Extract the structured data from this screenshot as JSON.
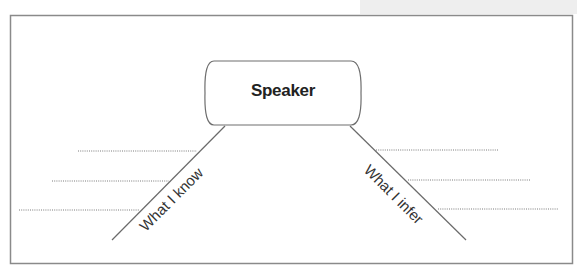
{
  "diagram": {
    "center_node": {
      "label": "Speaker"
    },
    "branches": [
      {
        "label": "What I know",
        "side": "left",
        "blank_lines": 3
      },
      {
        "label": "What I infer",
        "side": "right",
        "blank_lines": 3
      }
    ]
  },
  "colors": {
    "frame": "#8a8a8a",
    "lines": "#6a6a6a",
    "text": "#222222"
  }
}
